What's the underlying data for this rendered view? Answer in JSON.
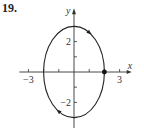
{
  "problem_number": "19.",
  "chart_data": {
    "type": "line",
    "title": "",
    "xlabel": "x",
    "ylabel": "y",
    "xlim": [
      -3.4,
      3.4
    ],
    "ylim": [
      -3.4,
      4.2
    ],
    "x_ticks": [
      -3,
      -2,
      -1,
      1,
      2,
      3
    ],
    "y_ticks": [
      -3,
      -2,
      -1,
      1,
      2,
      3
    ],
    "x_tick_labels": [
      {
        "value": -3,
        "label": "−3"
      },
      {
        "value": 3,
        "label": "3"
      }
    ],
    "y_tick_labels": [
      {
        "value": 2,
        "label": "2"
      },
      {
        "value": -2,
        "label": "−2"
      }
    ],
    "curve": {
      "kind": "ellipse",
      "equation": "x^2/4 + y^2/9 = 1",
      "center": [
        0,
        0
      ],
      "semi_axis_x": 2,
      "semi_axis_y": 3,
      "direction": "clockwise"
    },
    "marked_points": [
      {
        "x": 2,
        "y": 0
      }
    ],
    "arrows": [
      {
        "at_angle_deg": 60,
        "direction": "clockwise"
      },
      {
        "at_angle_deg": 240,
        "direction": "clockwise"
      }
    ],
    "grid": false,
    "legend": "none"
  }
}
